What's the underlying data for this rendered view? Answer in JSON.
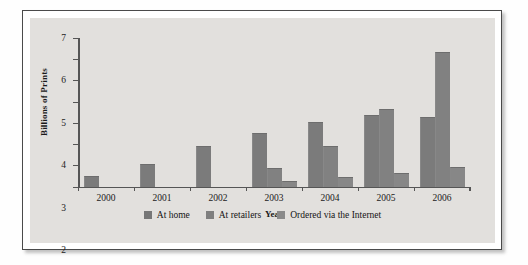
{
  "chart_data": {
    "type": "bar",
    "title": "",
    "xlabel": "Year",
    "ylabel": "Billions of Prints",
    "categories": [
      "2000",
      "2001",
      "2002",
      "2003",
      "2004",
      "2005",
      "2006"
    ],
    "ylim": [
      0,
      7
    ],
    "yticks": [
      "0",
      "1",
      "2",
      "3",
      "4",
      "5",
      "6",
      "7"
    ],
    "grid": false,
    "legend_position": "bottom",
    "series": [
      {
        "name": "At home",
        "color": "#7b7b7b",
        "values": [
          0.5,
          1.05,
          1.9,
          2.5,
          3.05,
          3.35,
          3.3
        ]
      },
      {
        "name": "At retailers",
        "color": "#818181",
        "values": [
          null,
          null,
          null,
          0.85,
          1.9,
          3.65,
          6.35
        ]
      },
      {
        "name": "Ordered via the Internet",
        "color": "#878787",
        "values": [
          null,
          null,
          null,
          0.25,
          0.45,
          0.65,
          0.9
        ]
      }
    ]
  },
  "legend": {
    "items": [
      {
        "label": "At home",
        "swatch": "legend-swatch-at-home"
      },
      {
        "label": "At retailers",
        "swatch": "legend-swatch-at-retailers"
      },
      {
        "label": "Ordered via the Internet",
        "swatch": "legend-swatch-internet"
      }
    ]
  }
}
